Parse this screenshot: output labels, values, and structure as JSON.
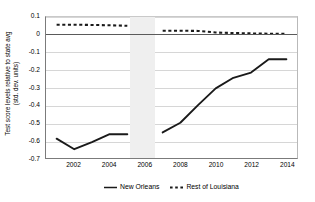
{
  "chart_data": {
    "type": "line",
    "title": "",
    "xlabel": "",
    "ylabel": "Test score levels relative to state avg (std. dev. units)",
    "ylabel_line1": "Test score levels relative to state avg",
    "ylabel_line2": "(std. dev. units)",
    "xlim": [
      2000.4,
      2014.6
    ],
    "ylim": [
      -0.7,
      0.1
    ],
    "grid": true,
    "grid_axis": "y",
    "legend_position": "bottom-center",
    "y_ticks": [
      "0.1",
      "0",
      "-0.1",
      "-0.2",
      "-0.3",
      "-0.4",
      "-0.5",
      "-0.6",
      "-0.7"
    ],
    "y_tick_values": [
      0.1,
      0,
      -0.1,
      -0.2,
      -0.3,
      -0.4,
      -0.5,
      -0.6,
      -0.7
    ],
    "x_ticks": [
      "2002",
      "2004",
      "2006",
      "2008",
      "2010",
      "2012",
      "2014"
    ],
    "x_tick_values": [
      2002,
      2004,
      2006,
      2008,
      2010,
      2012,
      2014
    ],
    "zero_reference_line": 0,
    "shaded_band": {
      "label": "",
      "x_start": 2005.1,
      "x_end": 2006.5,
      "color": "#efefef"
    },
    "series": [
      {
        "name": "New Orleans",
        "style": "solid",
        "color": "#1a1a1a",
        "width": 1.9,
        "segments": [
          {
            "x": [
              2001,
              2002,
              2003,
              2004,
              2005
            ],
            "values": [
              -0.59,
              -0.65,
              -0.61,
              -0.565,
              -0.565
            ]
          },
          {
            "x": [
              2007,
              2008,
              2009,
              2010,
              2011,
              2012,
              2013,
              2014
            ],
            "values": [
              -0.555,
              -0.5,
              -0.4,
              -0.305,
              -0.245,
              -0.215,
              -0.14,
              -0.14
            ]
          }
        ]
      },
      {
        "name": "Rest of Louisiana",
        "style": "dotted",
        "color": "#1a1a1a",
        "width": 2.1,
        "segments": [
          {
            "x": [
              2001,
              2002,
              2003,
              2004,
              2005
            ],
            "values": [
              0.056,
              0.056,
              0.055,
              0.053,
              0.05
            ]
          },
          {
            "x": [
              2007,
              2008,
              2009,
              2010,
              2011,
              2012,
              2013,
              2014
            ],
            "values": [
              0.022,
              0.022,
              0.021,
              0.012,
              0.009,
              0.007,
              0.005,
              0.004
            ]
          }
        ]
      }
    ],
    "legend": [
      {
        "label": "New Orleans",
        "style": "solid"
      },
      {
        "label": "Rest of Louisiana",
        "style": "dotted"
      }
    ]
  }
}
